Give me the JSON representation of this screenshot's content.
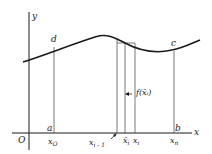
{
  "diagram": {
    "axes": {
      "x_label": "x",
      "y_label": "y",
      "origin_label": "O"
    },
    "curve_points": {
      "top_left": "d",
      "top_right": "c",
      "bottom_left": "a",
      "bottom_right": "b"
    },
    "x_ticks": {
      "x0": {
        "base": "x",
        "sub": "O"
      },
      "x_im1": {
        "base": "x",
        "sub": "i - 1"
      },
      "x_bar_i": {
        "base": "x̄",
        "sub": "i"
      },
      "x_i": {
        "base": "x",
        "sub": "i"
      },
      "x_n": {
        "base": "x",
        "sub": "n"
      }
    },
    "height_annotation": "f(x̄ᵢ)",
    "colors": {
      "line": "#1a1a1a",
      "thin_line": "#555555",
      "background": "#ffffff"
    }
  }
}
